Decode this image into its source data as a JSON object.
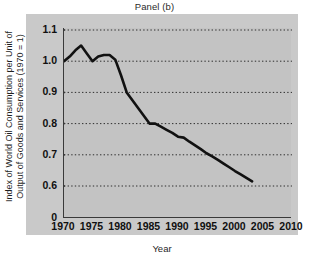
{
  "chart_data": {
    "type": "line",
    "title": "Panel (b)",
    "xlabel": "Year",
    "ylabel": "Index of World Oil Consumption per Unit of Output of Goods and Services (1970 = 1)",
    "ylabel_line1": "Index of World Oil Consumption per Unit of",
    "ylabel_line2": "Output of Goods and Services (1970 = 1)",
    "xlim": [
      1970,
      2010
    ],
    "ylim": [
      0.56,
      1.13
    ],
    "yticks": [
      "1.1",
      "1.0",
      "0.9",
      "0.8",
      "0.7",
      "0.6",
      "0"
    ],
    "ytick_values": [
      1.1,
      1.0,
      0.9,
      0.8,
      0.7,
      0.6,
      0
    ],
    "xticks": [
      "1970",
      "1975",
      "1980",
      "1985",
      "1990",
      "1995",
      "2000",
      "2005",
      "2010"
    ],
    "xtick_values": [
      1970,
      1975,
      1980,
      1985,
      1990,
      1995,
      2000,
      2005,
      2010
    ],
    "grid": "horizontal-dotted",
    "legend": "none",
    "axis_break_below": 0.6,
    "line_color": "#111111",
    "panel_color": "#c9c9c9",
    "plot_background": "#c3c3c3",
    "series": [
      {
        "name": "World oil consumption per unit of output (1970 = 1)",
        "x": [
          1970,
          1971,
          1972,
          1973,
          1974,
          1975,
          1976,
          1977,
          1978,
          1979,
          1980,
          1981,
          1982,
          1983,
          1984,
          1985,
          1986,
          1987,
          1988,
          1989,
          1990,
          1991,
          1992,
          1993,
          1994,
          1995,
          1996,
          1997,
          1998,
          1999,
          2000,
          2001,
          2002,
          2003
        ],
        "values": [
          1.0,
          1.015,
          1.035,
          1.05,
          1.025,
          1.0,
          1.015,
          1.02,
          1.02,
          1.005,
          0.955,
          0.9,
          0.875,
          0.85,
          0.825,
          0.8,
          0.8,
          0.79,
          0.78,
          0.77,
          0.758,
          0.755,
          0.742,
          0.73,
          0.718,
          0.705,
          0.695,
          0.684,
          0.672,
          0.66,
          0.648,
          0.637,
          0.626,
          0.615
        ]
      }
    ]
  }
}
